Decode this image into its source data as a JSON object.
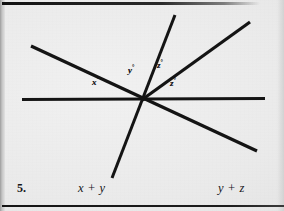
{
  "page": {
    "background_color": "#e9e9e9",
    "ink_color": "#141414",
    "width": 284,
    "height": 211
  },
  "rules": {
    "top_rule_name": "top-horizontal-rule",
    "bottom_rule_name": "bottom-horizontal-rule"
  },
  "figure": {
    "vertex": {
      "x": 143,
      "y": 99
    },
    "lines": [
      {
        "name": "horizontal-line",
        "x1": 22,
        "y1": 99.5,
        "x2": 265,
        "y2": 98.5
      },
      {
        "name": "descending-diagonal-line",
        "x1": 31,
        "y1": 46,
        "x2": 257,
        "y2": 151
      },
      {
        "name": "steep-line",
        "x1": 175,
        "y1": 15,
        "x2": 112,
        "y2": 178
      },
      {
        "name": "upper-right-ray",
        "x1": 143,
        "y1": 99,
        "x2": 250,
        "y2": 22
      }
    ],
    "angle_labels": [
      {
        "name": "angle-label-x",
        "symbol": "x",
        "unit": "°",
        "x": 92,
        "y": 80
      },
      {
        "name": "angle-label-y",
        "symbol": "y",
        "unit": "°",
        "x": 128,
        "y": 68
      },
      {
        "name": "angle-label-z-upper",
        "symbol": "z",
        "unit": "°",
        "x": 157,
        "y": 63
      },
      {
        "name": "angle-label-z-lower",
        "symbol": "z",
        "unit": "°",
        "x": 170,
        "y": 81
      }
    ]
  },
  "caption": {
    "number": "5.",
    "left_expression": "x + y",
    "right_expression": "y + z"
  }
}
